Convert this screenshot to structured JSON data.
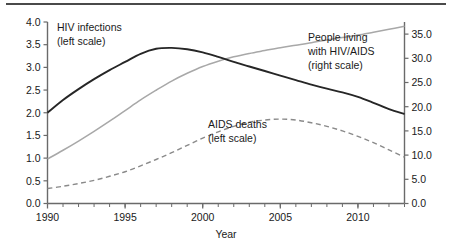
{
  "chart_data": {
    "type": "line",
    "title": "",
    "xlabel": "Year",
    "ylabel": "",
    "grid": false,
    "legend_position": "inline-annotations",
    "x": [
      1990,
      1991,
      1992,
      1993,
      1994,
      1995,
      1996,
      1997,
      1998,
      1999,
      2000,
      2001,
      2002,
      2003,
      2004,
      2005,
      2006,
      2007,
      2008,
      2009,
      2010,
      2011,
      2012,
      2013
    ],
    "xlim": [
      1990,
      2013
    ],
    "xticks_labeled": [
      "1990",
      "1995",
      "2000",
      "2005",
      "2010"
    ],
    "xticks_labeled_values": [
      1990,
      1995,
      2000,
      2005,
      2010
    ],
    "xtick_interval_minor": 1,
    "left_axis": {
      "ylim": [
        0.0,
        4.0
      ],
      "ticks": [
        "0.0",
        "0.5",
        "1.0",
        "1.5",
        "2.0",
        "2.5",
        "3.0",
        "3.5",
        "4.0"
      ],
      "tick_values": [
        0.0,
        0.5,
        1.0,
        1.5,
        2.0,
        2.5,
        3.0,
        3.5,
        4.0
      ]
    },
    "right_axis": {
      "ylim": [
        0.0,
        37.5
      ],
      "ticks": [
        "0.0",
        "5.0",
        "10.0",
        "15.0",
        "20.0",
        "25.0",
        "30.0",
        "35.0"
      ],
      "tick_values": [
        0.0,
        5.0,
        10.0,
        15.0,
        20.0,
        25.0,
        30.0,
        35.0
      ]
    },
    "series": [
      {
        "name": "HIV infections",
        "scale": "left",
        "style": "solid",
        "color": "#262626",
        "label_line1": "HIV infections",
        "label_line2": "(left scale)",
        "values": [
          2.0,
          2.28,
          2.52,
          2.74,
          2.94,
          3.12,
          3.3,
          3.41,
          3.43,
          3.4,
          3.33,
          3.23,
          3.12,
          3.02,
          2.92,
          2.82,
          2.72,
          2.62,
          2.53,
          2.45,
          2.35,
          2.22,
          2.08,
          1.97
        ]
      },
      {
        "name": "People living with HIV/AIDS",
        "scale": "right",
        "style": "solid",
        "color": "#a8a8a8",
        "label_line1": "People living",
        "label_line2": "with HIV/AIDS",
        "label_line3": "(right scale)",
        "values": [
          9.2,
          11.0,
          12.9,
          14.9,
          17.0,
          19.2,
          21.4,
          23.4,
          25.3,
          26.9,
          28.3,
          29.4,
          30.3,
          31.0,
          31.6,
          32.2,
          32.7,
          33.2,
          33.8,
          34.3,
          34.8,
          35.4,
          36.0,
          36.6
        ]
      },
      {
        "name": "AIDS deaths",
        "scale": "left",
        "style": "dashed",
        "color": "#8a8a8a",
        "label_line1": "AIDS deaths",
        "label_line2": "(left scale)",
        "values": [
          0.33,
          0.38,
          0.44,
          0.51,
          0.6,
          0.7,
          0.83,
          0.97,
          1.12,
          1.28,
          1.44,
          1.58,
          1.7,
          1.79,
          1.84,
          1.86,
          1.84,
          1.78,
          1.7,
          1.6,
          1.48,
          1.34,
          1.18,
          1.02
        ]
      }
    ]
  },
  "annotations": {
    "hiv_infections": {
      "line1": "HIV infections",
      "line2": "(left scale)"
    },
    "people_living": {
      "line1": "People living",
      "line2": "with HIV/AIDS",
      "line3": "(right scale)"
    },
    "aids_deaths": {
      "line1": "AIDS deaths",
      "line2": "(left scale)"
    }
  },
  "axis": {
    "x_title": "Year",
    "left_ticks": [
      "4.0",
      "3.5",
      "3.0",
      "2.5",
      "2.0",
      "1.5",
      "1.0",
      "0.5",
      "0.0"
    ],
    "right_ticks": [
      "35.0",
      "30.0",
      "25.0",
      "20.0",
      "15.0",
      "10.0",
      "5.0",
      "0.0"
    ],
    "x_ticks": [
      "1990",
      "1995",
      "2000",
      "2005",
      "2010"
    ]
  }
}
